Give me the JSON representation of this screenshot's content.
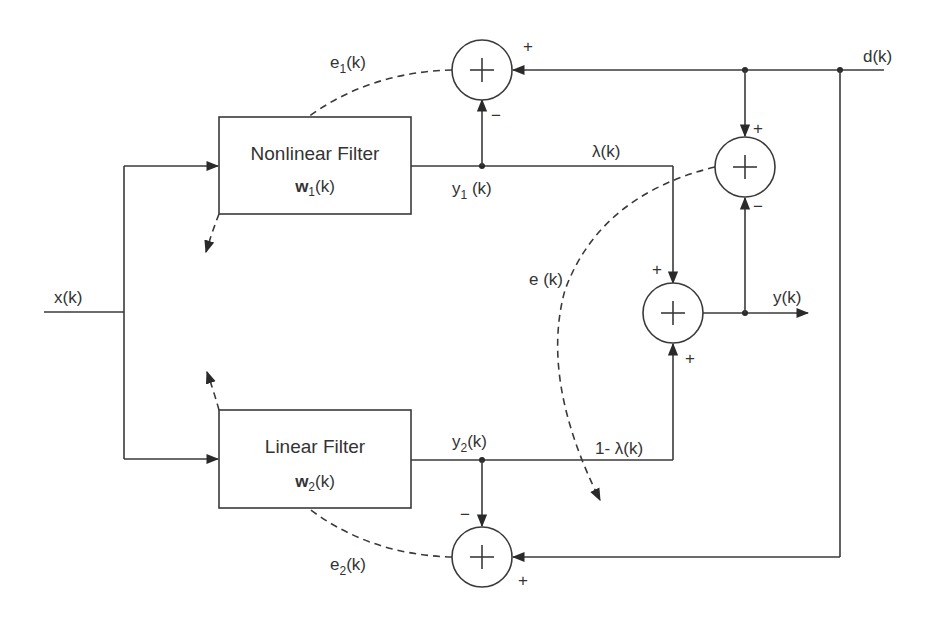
{
  "diagram": {
    "type": "block-diagram",
    "input_label": "x(k)",
    "desired_label": "d(k)",
    "output_label": "y(k)",
    "blocks": [
      {
        "id": "nonlinear",
        "title": "Nonlinear Filter",
        "weight_symbol": "w",
        "weight_sub": "1",
        "weight_arg": "(k)"
      },
      {
        "id": "linear",
        "title": "Linear Filter",
        "weight_symbol": "w",
        "weight_sub": "2",
        "weight_arg": "(k)"
      }
    ],
    "signals": {
      "y1": {
        "base": "y",
        "sub": "1",
        "arg": " (k)"
      },
      "y2": {
        "base": "y",
        "sub": "2",
        "arg": "(k)"
      },
      "e1": {
        "base": "e",
        "sub": "1",
        "arg": "(k)"
      },
      "e2": {
        "base": "e",
        "sub": "2",
        "arg": "(k)"
      },
      "e": "e (k)",
      "lambda": "λ(k)",
      "one_minus_lambda": "1- λ(k)"
    },
    "summers": [
      {
        "id": "sum-e1",
        "symbol": "+",
        "inputs": [
          {
            "from": "d(k)",
            "sign": "+"
          },
          {
            "from": "y1(k)",
            "sign": "−"
          }
        ]
      },
      {
        "id": "sum-e",
        "symbol": "+",
        "inputs": [
          {
            "from": "d(k)",
            "sign": "+"
          },
          {
            "from": "y(k)",
            "sign": "−"
          }
        ]
      },
      {
        "id": "sum-y",
        "symbol": "+",
        "inputs": [
          {
            "from": "λ(k)·y1",
            "sign": "+"
          },
          {
            "from": "(1-λ(k))·y2",
            "sign": "+"
          }
        ]
      },
      {
        "id": "sum-e2",
        "symbol": "+",
        "inputs": [
          {
            "from": "y2(k)",
            "sign": "−"
          },
          {
            "from": "d(k)",
            "sign": "+"
          }
        ]
      }
    ],
    "signs": {
      "plus": "+",
      "minus": "−"
    }
  }
}
